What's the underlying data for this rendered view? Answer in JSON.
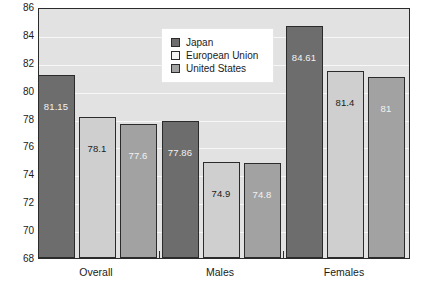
{
  "chart_data": {
    "type": "bar",
    "title": "",
    "subtitle": "",
    "xlabel": "",
    "ylabel": "",
    "categories": [
      "Overall",
      "Males",
      "Females"
    ],
    "series": [
      {
        "name": "Japan",
        "color": "#6d6d6d",
        "values": [
          81.15,
          77.86,
          84.61
        ],
        "labels": [
          "81.15",
          "77.86",
          "84.61"
        ]
      },
      {
        "name": "European Union",
        "color": "#cfcfcf",
        "values": [
          78.1,
          74.9,
          81.4
        ],
        "labels": [
          "78.1",
          "74.9",
          "81.4"
        ]
      },
      {
        "name": "United States",
        "color": "#a2a2a2",
        "values": [
          77.6,
          74.8,
          81.0
        ],
        "labels": [
          "77.6",
          "74.8",
          "81"
        ]
      }
    ],
    "ylim": [
      68,
      86
    ],
    "yticks": [
      68,
      70,
      72,
      74,
      76,
      78,
      80,
      82,
      84,
      86
    ],
    "ytick_labels": [
      "68",
      "70",
      "72",
      "74",
      "76",
      "78",
      "80",
      "82",
      "84",
      "86"
    ],
    "grid": true,
    "grid_color": "#f7f7f7",
    "legend_position": "upper center",
    "plot_background": "#e2e2e2",
    "frame_color": "#2b2b2b"
  },
  "legend": {
    "entries": [
      {
        "label": "Japan"
      },
      {
        "label": "European Union"
      },
      {
        "label": "United States"
      }
    ]
  }
}
